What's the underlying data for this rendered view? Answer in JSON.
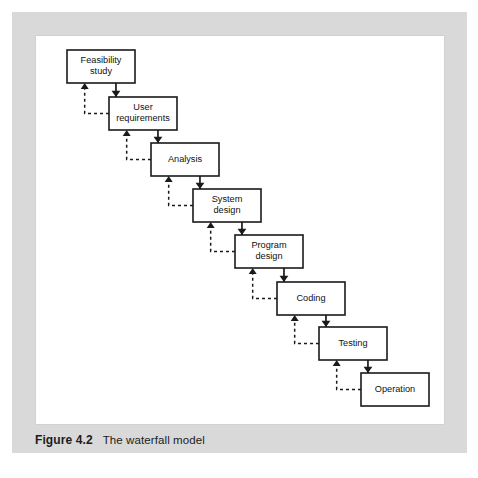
{
  "figure": {
    "caption_number": "Figure 4.2",
    "caption_text": "The waterfall model",
    "plate_color": "#d9d9d9",
    "panel_color": "#ffffff",
    "panel_border_color": "#d2d2d2",
    "line_color": "#1a1a1a",
    "box_fill": "#ffffff"
  },
  "chart_data": {
    "type": "diagram",
    "diagram_kind": "waterfall-model-flowchart",
    "title": "The waterfall model",
    "stage_count": 8,
    "stages": [
      {
        "id": "feasibility-study",
        "label": "Feasibility study",
        "line1": "Feasibility",
        "line2": "study",
        "order": 1,
        "x": 31,
        "y": 14,
        "w": 68,
        "h": 33
      },
      {
        "id": "user-requirements",
        "label": "User requirements",
        "line1": "User",
        "line2": "requirements",
        "order": 2,
        "x": 73,
        "y": 61,
        "w": 68,
        "h": 33
      },
      {
        "id": "analysis",
        "label": "Analysis",
        "line1": "Analysis",
        "line2": "",
        "order": 3,
        "x": 115,
        "y": 107,
        "w": 68,
        "h": 33
      },
      {
        "id": "system-design",
        "label": "System design",
        "line1": "System",
        "line2": "design",
        "order": 4,
        "x": 157,
        "y": 153,
        "w": 68,
        "h": 33
      },
      {
        "id": "program-design",
        "label": "Program design",
        "line1": "Program",
        "line2": "design",
        "order": 5,
        "x": 199,
        "y": 199,
        "w": 68,
        "h": 33
      },
      {
        "id": "coding",
        "label": "Coding",
        "line1": "Coding",
        "line2": "",
        "order": 6,
        "x": 241,
        "y": 246,
        "w": 68,
        "h": 33
      },
      {
        "id": "testing",
        "label": "Testing",
        "line1": "Testing",
        "line2": "",
        "order": 7,
        "x": 283,
        "y": 291,
        "w": 68,
        "h": 33
      },
      {
        "id": "operation",
        "label": "Operation",
        "line1": "Operation",
        "line2": "",
        "order": 8,
        "x": 325,
        "y": 337,
        "w": 68,
        "h": 33
      }
    ],
    "forward_edges": [
      {
        "from": "feasibility-study",
        "to": "user-requirements",
        "style": "solid",
        "direction": "down"
      },
      {
        "from": "user-requirements",
        "to": "analysis",
        "style": "solid",
        "direction": "down"
      },
      {
        "from": "analysis",
        "to": "system-design",
        "style": "solid",
        "direction": "down"
      },
      {
        "from": "system-design",
        "to": "program-design",
        "style": "solid",
        "direction": "down"
      },
      {
        "from": "program-design",
        "to": "coding",
        "style": "solid",
        "direction": "down"
      },
      {
        "from": "coding",
        "to": "testing",
        "style": "solid",
        "direction": "down"
      },
      {
        "from": "testing",
        "to": "operation",
        "style": "solid",
        "direction": "down"
      }
    ],
    "feedback_edges": [
      {
        "from": "user-requirements",
        "to": "feasibility-study",
        "style": "dashed",
        "direction": "up"
      },
      {
        "from": "analysis",
        "to": "user-requirements",
        "style": "dashed",
        "direction": "up"
      },
      {
        "from": "system-design",
        "to": "analysis",
        "style": "dashed",
        "direction": "up"
      },
      {
        "from": "program-design",
        "to": "system-design",
        "style": "dashed",
        "direction": "up"
      },
      {
        "from": "coding",
        "to": "program-design",
        "style": "dashed",
        "direction": "up"
      },
      {
        "from": "testing",
        "to": "coding",
        "style": "dashed",
        "direction": "up"
      },
      {
        "from": "operation",
        "to": "testing",
        "style": "dashed",
        "direction": "up"
      }
    ],
    "legend": []
  }
}
